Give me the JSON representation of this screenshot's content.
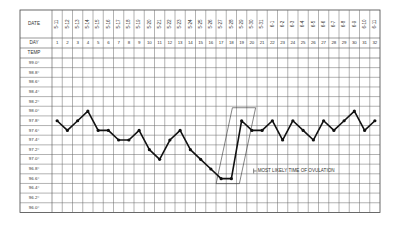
{
  "chart_data": {
    "type": "line",
    "row_labels": {
      "date": "DATE",
      "day": "DAY",
      "temp": "TEMP"
    },
    "dates": [
      "5-11",
      "5-12",
      "5-13",
      "5-14",
      "5-15",
      "5-16",
      "5-17",
      "5-18",
      "5-19",
      "5-20",
      "5-21",
      "5-22",
      "5-23",
      "5-24",
      "5-25",
      "5-26",
      "5-27",
      "5-28",
      "5-29",
      "5-30",
      "5-31",
      "6-1",
      "6-2",
      "6-3",
      "6-4",
      "6-5",
      "6-6",
      "6-7",
      "6-8",
      "6-9",
      "6-10",
      "6-11"
    ],
    "days": [
      1,
      2,
      3,
      4,
      5,
      6,
      7,
      8,
      9,
      10,
      11,
      12,
      13,
      14,
      15,
      16,
      17,
      18,
      19,
      20,
      21,
      22,
      23,
      24,
      25,
      26,
      27,
      28,
      29,
      30,
      31,
      32
    ],
    "temp_ticks": [
      "99.0°",
      "98.8°",
      "98.6°",
      "98.4°",
      "98.2°",
      "98.0°",
      "97.8°",
      "97.6°",
      "97.4°",
      "97.2°",
      "97.0°",
      "96.8°",
      "96.6°",
      "96.4°",
      "96.2°",
      "96.0°"
    ],
    "ylim": [
      96.0,
      99.0
    ],
    "series": [
      {
        "name": "Temperature",
        "values": [
          97.8,
          97.6,
          97.8,
          98.0,
          97.6,
          97.6,
          97.4,
          97.4,
          97.6,
          97.2,
          97.0,
          97.4,
          97.6,
          97.2,
          97.0,
          96.8,
          96.6,
          96.6,
          97.8,
          97.6,
          97.6,
          97.8,
          97.4,
          97.8,
          97.6,
          97.4,
          97.8,
          97.6,
          97.8,
          98.0,
          97.6,
          97.8
        ]
      }
    ],
    "annotation": {
      "text": "MOST LIKELY TIME OF OVULATION",
      "days": [
        17,
        18,
        19
      ]
    },
    "grid": true
  }
}
